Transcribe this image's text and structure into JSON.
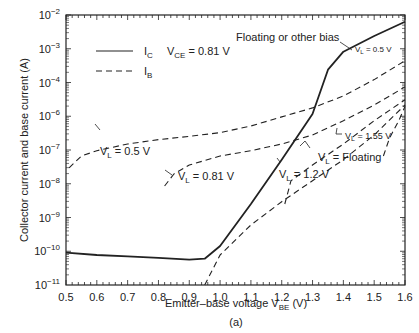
{
  "chart_data": {
    "type": "line",
    "title": "",
    "caption": "(a)",
    "xlabel": "Emitter–base voltage V_BE (V)",
    "ylabel": "Collector current and base current (A)",
    "xlim": [
      0.5,
      1.6
    ],
    "yscale": "log",
    "ylim": [
      1e-11,
      0.01
    ],
    "x_ticks": [
      "0.5",
      "0.6",
      "0.7",
      "0.8",
      "0.9",
      "1.0",
      "1.1",
      "1.2",
      "1.3",
      "1.4",
      "1.5",
      "1.6"
    ],
    "y_ticks": [
      "10^-2",
      "10^-3",
      "10^-4",
      "10^-6",
      "10^-7",
      "10^-8",
      "10^-9",
      "10^-10",
      "10^-11"
    ],
    "grid": false,
    "legend": {
      "position": "upper-left",
      "entries": [
        {
          "label": "I_C",
          "style": "solid"
        },
        {
          "label": "I_B",
          "style": "dashed"
        }
      ]
    },
    "annotations": [
      "V_CE = 0.81 V",
      "Floating or other bias",
      "V_L = 0.5 V",
      "V_L = 0.5 V",
      "V_L = 0.81 V",
      "V_L = 1.55 V",
      "V_L = Floating",
      "V_L = 1.2 V"
    ],
    "series": [
      {
        "name": "I_C (all biases)",
        "style": "solid",
        "x": [
          0.5,
          0.6,
          0.7,
          0.8,
          0.9,
          0.95,
          1.0,
          1.1,
          1.2,
          1.3,
          1.35,
          1.4,
          1.5,
          1.6
        ],
        "y": [
          1.2e-10,
          1e-10,
          9e-11,
          8e-11,
          7e-11,
          7.5e-11,
          2e-10,
          5e-09,
          1.5e-07,
          5e-06,
          0.00015,
          0.0006,
          0.002,
          0.006
        ]
      },
      {
        "name": "I_B V_L=0.5 V",
        "style": "dashed",
        "x": [
          0.51,
          0.55,
          0.6,
          0.7,
          0.8,
          0.9,
          1.0,
          1.1,
          1.2,
          1.3,
          1.4,
          1.5,
          1.6
        ],
        "y": [
          8e-08,
          2e-07,
          3e-07,
          5e-07,
          7e-07,
          9e-07,
          1.2e-06,
          2e-06,
          4e-06,
          8e-06,
          2e-05,
          7e-05,
          0.0003
        ]
      },
      {
        "name": "I_B V_L=0.81 V",
        "style": "dashed",
        "x": [
          0.82,
          0.85,
          0.9,
          1.0,
          1.1,
          1.2,
          1.3,
          1.4,
          1.5,
          1.6
        ],
        "y": [
          2e-08,
          5e-08,
          1e-07,
          2e-07,
          3e-07,
          5e-07,
          1e-06,
          3e-06,
          1e-05,
          4e-05
        ]
      },
      {
        "name": "I_B V_L=1.2 V",
        "style": "dashed",
        "x": [
          1.21,
          1.23,
          1.3,
          1.4,
          1.5,
          1.6
        ],
        "y": [
          5e-09,
          3e-08,
          1e-07,
          5e-07,
          3e-06,
          1.5e-05
        ]
      },
      {
        "name": "I_B V_L=Floating",
        "style": "dashed",
        "x": [
          0.95,
          1.0,
          1.1,
          1.2,
          1.3,
          1.4,
          1.5,
          1.6
        ],
        "y": [
          1e-11,
          1e-10,
          1e-09,
          6e-09,
          3e-08,
          1.5e-07,
          1e-06,
          1e-05
        ]
      },
      {
        "name": "I_B V_L=1.55 V",
        "style": "dashed",
        "x": [
          1.53,
          1.55,
          1.58,
          1.6
        ],
        "y": [
          2e-07,
          8e-07,
          3e-06,
          9e-06
        ]
      }
    ]
  },
  "labels": {
    "ylabel": "Collector current and base current (A)",
    "xlabel_main": "Emitter–base voltage V",
    "xlabel_sub": "BE",
    "xlabel_unit": " (V)",
    "caption": "(a)",
    "legend_ic": "I",
    "legend_ic_sub": "C",
    "legend_ib": "I",
    "legend_ib_sub": "B",
    "vce_main": "V",
    "vce_sub": "CE",
    "vce_val": " = 0.81 V",
    "floating_bias": "Floating or other bias",
    "vl": "V",
    "vl_sub": "L",
    "vl_05": " = 0.5 V",
    "vl_081": " = 0.81 V",
    "vl_155": " = 1.55 V",
    "vl_float": " = Floating",
    "vl_12": " = 1.2 V"
  }
}
